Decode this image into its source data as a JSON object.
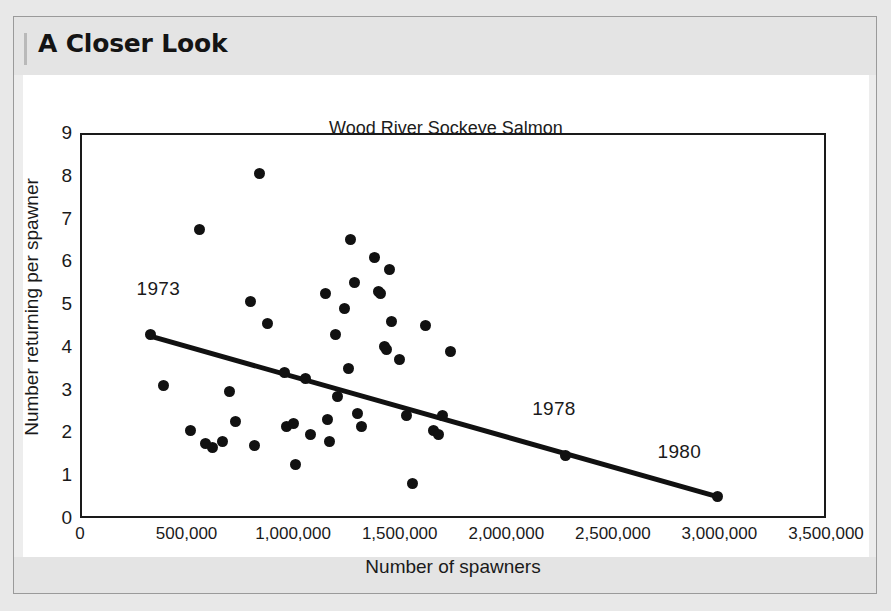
{
  "header": {
    "title": "A Closer Look"
  },
  "chart_data": {
    "type": "scatter",
    "title": "Wood River Sockeye Salmon",
    "xlabel": "Number of spawners",
    "ylabel": "Number returning per spawner",
    "xlim": [
      0,
      3500000
    ],
    "ylim": [
      0,
      9
    ],
    "grid": false,
    "legend": null,
    "xticks": [
      "0",
      "500,000",
      "1,000,000",
      "1,500,000",
      "2,000,000",
      "2,500,000",
      "3,000,000",
      "3,500,000"
    ],
    "xtick_values": [
      0,
      500000,
      1000000,
      1500000,
      2000000,
      2500000,
      3000000,
      3500000
    ],
    "yticks": [
      "0",
      "1",
      "2",
      "3",
      "4",
      "5",
      "6",
      "7",
      "8",
      "9"
    ],
    "ytick_values": [
      0,
      1,
      2,
      3,
      4,
      5,
      6,
      7,
      8,
      9
    ],
    "points": [
      {
        "x": 330000,
        "y": 4.3
      },
      {
        "x": 390000,
        "y": 3.1
      },
      {
        "x": 520000,
        "y": 2.05
      },
      {
        "x": 560000,
        "y": 6.75
      },
      {
        "x": 590000,
        "y": 1.75
      },
      {
        "x": 620000,
        "y": 1.65
      },
      {
        "x": 670000,
        "y": 1.8
      },
      {
        "x": 700000,
        "y": 2.95
      },
      {
        "x": 730000,
        "y": 2.25
      },
      {
        "x": 800000,
        "y": 5.05
      },
      {
        "x": 820000,
        "y": 1.7
      },
      {
        "x": 840000,
        "y": 8.05
      },
      {
        "x": 880000,
        "y": 4.55
      },
      {
        "x": 960000,
        "y": 3.4
      },
      {
        "x": 970000,
        "y": 2.15
      },
      {
        "x": 1000000,
        "y": 2.2
      },
      {
        "x": 1010000,
        "y": 1.25
      },
      {
        "x": 1060000,
        "y": 3.25
      },
      {
        "x": 1080000,
        "y": 1.95
      },
      {
        "x": 1150000,
        "y": 5.25
      },
      {
        "x": 1160000,
        "y": 2.3
      },
      {
        "x": 1170000,
        "y": 1.8
      },
      {
        "x": 1200000,
        "y": 4.3
      },
      {
        "x": 1210000,
        "y": 2.85
      },
      {
        "x": 1240000,
        "y": 4.9
      },
      {
        "x": 1260000,
        "y": 3.5
      },
      {
        "x": 1270000,
        "y": 6.5
      },
      {
        "x": 1290000,
        "y": 5.5
      },
      {
        "x": 1300000,
        "y": 2.45
      },
      {
        "x": 1320000,
        "y": 2.15
      },
      {
        "x": 1380000,
        "y": 6.1
      },
      {
        "x": 1400000,
        "y": 5.3
      },
      {
        "x": 1410000,
        "y": 5.25
      },
      {
        "x": 1430000,
        "y": 4.0
      },
      {
        "x": 1440000,
        "y": 3.95
      },
      {
        "x": 1450000,
        "y": 5.8
      },
      {
        "x": 1460000,
        "y": 4.6
      },
      {
        "x": 1500000,
        "y": 3.7
      },
      {
        "x": 1530000,
        "y": 2.4
      },
      {
        "x": 1560000,
        "y": 0.8
      },
      {
        "x": 1620000,
        "y": 4.5
      },
      {
        "x": 1660000,
        "y": 2.05
      },
      {
        "x": 1680000,
        "y": 1.95
      },
      {
        "x": 1700000,
        "y": 2.4
      },
      {
        "x": 1740000,
        "y": 3.9
      },
      {
        "x": 2280000,
        "y": 1.45
      },
      {
        "x": 2990000,
        "y": 0.5
      }
    ],
    "trendline": {
      "x_start": 330000,
      "y_start": 4.25,
      "x_end": 2990000,
      "y_end": 0.5
    },
    "annotations": [
      {
        "label": "1973",
        "x": 330000,
        "y": 4.3,
        "dx": 8,
        "dy": -34
      },
      {
        "label": "1978",
        "x": 2280000,
        "y": 1.45,
        "dx": -12,
        "dy": -36
      },
      {
        "label": "1980",
        "x": 2990000,
        "y": 0.5,
        "dx": -38,
        "dy": -34
      }
    ]
  }
}
